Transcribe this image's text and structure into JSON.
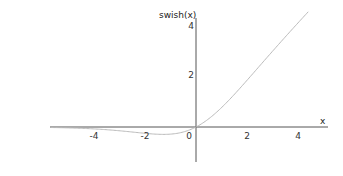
{
  "chart_data": {
    "type": "line",
    "title": "",
    "xlabel": "x",
    "ylabel": "swish(x)",
    "xlim": [
      -5.8,
      5.0
    ],
    "ylim": [
      -1.3,
      4.2
    ],
    "grid": false,
    "legend": null,
    "x_ticks": [
      -4,
      -2,
      0,
      2,
      4
    ],
    "x_tick_labels": [
      "-4",
      "-2",
      "0",
      "2",
      "4"
    ],
    "y_ticks": [
      2,
      4
    ],
    "y_tick_labels": [
      "2",
      "4"
    ],
    "series": [
      {
        "name": "swish(x)",
        "color": "#bbbbbb",
        "x": [
          -5.7,
          -5.0,
          -4.5,
          -4.0,
          -3.5,
          -3.0,
          -2.5,
          -2.0,
          -1.5,
          -1.28,
          -1.0,
          -0.5,
          0.0,
          0.5,
          1.0,
          1.5,
          2.0,
          2.5,
          3.0,
          3.5,
          4.0,
          4.4
        ],
        "values": [
          -0.019,
          -0.033,
          -0.049,
          -0.072,
          -0.101,
          -0.142,
          -0.189,
          -0.238,
          -0.274,
          -0.278,
          -0.269,
          -0.189,
          0.0,
          0.311,
          0.731,
          1.226,
          1.762,
          2.317,
          2.858,
          3.395,
          3.928,
          4.346
        ]
      }
    ]
  },
  "colors": {
    "axis": "#555555",
    "curve": "#bbbbbb",
    "background": "#ffffff"
  }
}
